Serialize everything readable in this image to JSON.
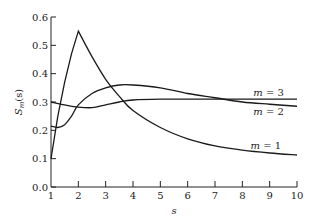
{
  "chart_data": {
    "type": "line",
    "title": "",
    "xlabel": "s",
    "ylabel": "S_m(s)",
    "ylabel_main": "S",
    "ylabel_sub": "m",
    "ylabel_arg": "(s)",
    "xlim": [
      1,
      10
    ],
    "ylim": [
      0.0,
      0.6
    ],
    "grid": false,
    "legend": "inline curve labels",
    "x_ticks": [
      1,
      2,
      3,
      4,
      5,
      6,
      7,
      8,
      9,
      10
    ],
    "x_tick_labels": [
      "1",
      "2",
      "3",
      "4",
      "5",
      "6",
      "7",
      "8",
      "9",
      "10"
    ],
    "y_ticks": [
      0.0,
      0.1,
      0.2,
      0.3,
      0.4,
      0.5,
      0.6
    ],
    "y_tick_labels": [
      "0.0",
      "0.1",
      "0.2",
      "0.3",
      "0.4",
      "0.5",
      "0.6"
    ],
    "series": [
      {
        "name": "m = 1",
        "label": "m = 1",
        "x": [
          1,
          1.25,
          1.5,
          1.75,
          2,
          2.5,
          3,
          3.5,
          4,
          5,
          6,
          7,
          8,
          9,
          10
        ],
        "values": [
          0.1,
          0.25,
          0.37,
          0.47,
          0.55,
          0.46,
          0.38,
          0.32,
          0.27,
          0.21,
          0.17,
          0.145,
          0.13,
          0.12,
          0.113
        ]
      },
      {
        "name": "m = 2",
        "label": "m = 2",
        "x": [
          1,
          1.25,
          1.5,
          1.75,
          2,
          2.5,
          3,
          3.5,
          4,
          5,
          6,
          7,
          8,
          9,
          10
        ],
        "values": [
          0.215,
          0.21,
          0.22,
          0.25,
          0.29,
          0.33,
          0.35,
          0.36,
          0.36,
          0.35,
          0.33,
          0.315,
          0.3,
          0.292,
          0.285
        ]
      },
      {
        "name": "m = 3",
        "label": "m = 3",
        "x": [
          1,
          1.5,
          2,
          2.5,
          3,
          3.5,
          4,
          5,
          6,
          7,
          8,
          9,
          10
        ],
        "values": [
          0.3,
          0.29,
          0.282,
          0.28,
          0.29,
          0.3,
          0.307,
          0.31,
          0.31,
          0.31,
          0.31,
          0.31,
          0.31
        ]
      }
    ],
    "label_positions": [
      {
        "series": "m = 3",
        "s": 8.4,
        "value": 0.32
      },
      {
        "series": "m = 2",
        "s": 8.4,
        "value": 0.255
      },
      {
        "series": "m = 1",
        "s": 8.3,
        "value": 0.135
      }
    ]
  }
}
